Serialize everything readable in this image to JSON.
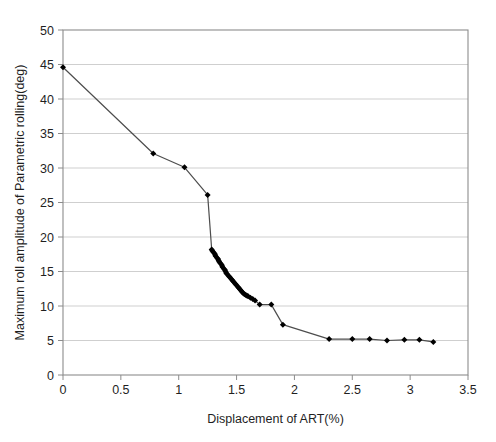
{
  "chart_data": {
    "type": "line",
    "title": "",
    "xlabel": "Displacement of ART(%)",
    "ylabel": "Maximum roll amplitude of Parametric rolling(deg)",
    "xlim": [
      0,
      3.5
    ],
    "ylim": [
      0,
      50
    ],
    "xticks": [
      "0",
      "0.5",
      "1",
      "1.5",
      "2",
      "2.5",
      "3",
      "3.5"
    ],
    "xtick_values": [
      0,
      0.5,
      1,
      1.5,
      2,
      2.5,
      3,
      3.5
    ],
    "yticks": [
      "0",
      "5",
      "10",
      "15",
      "20",
      "25",
      "30",
      "35",
      "40",
      "45",
      "50"
    ],
    "ytick_values": [
      0,
      5,
      10,
      15,
      20,
      25,
      30,
      35,
      40,
      45,
      50
    ],
    "grid": "horizontal",
    "legend": "none",
    "marker": "filled-diamond",
    "line_color": "#4d4d4d",
    "marker_color": "#000000",
    "series": [
      {
        "name": "Maximum roll amplitude",
        "x": [
          0.0,
          0.78,
          1.05,
          1.25,
          1.285,
          1.29,
          1.3,
          1.31,
          1.315,
          1.32,
          1.33,
          1.34,
          1.345,
          1.35,
          1.36,
          1.37,
          1.375,
          1.38,
          1.39,
          1.4,
          1.405,
          1.41,
          1.42,
          1.43,
          1.44,
          1.45,
          1.46,
          1.47,
          1.48,
          1.49,
          1.5,
          1.51,
          1.52,
          1.53,
          1.54,
          1.55,
          1.56,
          1.57,
          1.58,
          1.59,
          1.6,
          1.62,
          1.64,
          1.66,
          1.7,
          1.8,
          1.9,
          2.3,
          2.5,
          2.65,
          2.8,
          2.95,
          3.08,
          3.2
        ],
        "y": [
          44.6,
          32.1,
          30.1,
          26.1,
          18.2,
          18.0,
          17.8,
          17.6,
          17.4,
          17.2,
          17.0,
          16.8,
          16.6,
          16.4,
          16.2,
          16.0,
          15.8,
          15.6,
          15.4,
          15.2,
          15.0,
          14.8,
          14.6,
          14.4,
          14.2,
          14.0,
          13.8,
          13.6,
          13.4,
          13.2,
          13.0,
          12.8,
          12.6,
          12.4,
          12.2,
          12.0,
          11.8,
          11.7,
          11.6,
          11.5,
          11.4,
          11.2,
          11.0,
          10.8,
          10.2,
          10.2,
          7.3,
          5.2,
          5.2,
          5.2,
          5.0,
          5.1,
          5.1,
          4.8
        ]
      }
    ]
  },
  "plot_geometry": {
    "left": 63,
    "right": 468,
    "top": 30,
    "bottom": 375
  }
}
